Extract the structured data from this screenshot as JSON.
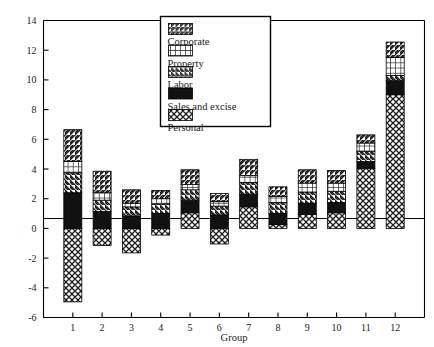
{
  "chart_data": {
    "type": "bar",
    "stacked": true,
    "title": "",
    "xlabel": "Group",
    "ylabel": "",
    "categories": [
      "1",
      "2",
      "3",
      "4",
      "5",
      "6",
      "7",
      "8",
      "9",
      "10",
      "11",
      "12"
    ],
    "ylim": [
      -6,
      14
    ],
    "yticks": [
      -6,
      -4,
      -2,
      0,
      2,
      4,
      6,
      8,
      10,
      12,
      14
    ],
    "xticks": [
      "1",
      "2",
      "3",
      "4",
      "5",
      "6",
      "7",
      "8",
      "9",
      "10",
      "11",
      "12"
    ],
    "grid": false,
    "legend_position": "top-center",
    "series": [
      {
        "name": "Personal",
        "fill": "cross-hatch",
        "values": [
          -4.95,
          -1.15,
          -1.65,
          -0.45,
          1.05,
          -1.05,
          1.45,
          0.25,
          0.95,
          1.05,
          4.05,
          9.0
        ]
      },
      {
        "name": "Sales and excise",
        "fill": "solid-black",
        "values": [
          2.4,
          1.15,
          0.85,
          1.0,
          0.85,
          0.9,
          0.85,
          0.75,
          0.75,
          0.7,
          0.45,
          0.95
        ]
      },
      {
        "name": "Labor",
        "fill": "diagonal-back",
        "values": [
          1.35,
          0.75,
          0.6,
          0.65,
          0.7,
          0.6,
          0.8,
          0.75,
          0.75,
          0.75,
          0.7,
          0.35
        ]
      },
      {
        "name": "Property",
        "fill": "grid-hatch",
        "values": [
          0.75,
          0.5,
          0.25,
          0.35,
          0.35,
          0.3,
          0.45,
          0.4,
          0.6,
          0.55,
          0.55,
          1.2
        ]
      },
      {
        "name": "Corporate",
        "fill": "diagonal-fwd",
        "values": [
          2.15,
          1.45,
          0.9,
          0.55,
          1.0,
          0.55,
          1.1,
          0.65,
          0.9,
          0.85,
          0.55,
          1.05
        ]
      }
    ],
    "bar_totals_positive": [
      6.65,
      3.85,
      2.6,
      2.55,
      3.95,
      2.35,
      4.65,
      2.8,
      3.95,
      3.9,
      6.3,
      12.55
    ],
    "bar_totals_negative": [
      -4.95,
      -1.15,
      -1.65,
      -0.45,
      0,
      -1.05,
      0,
      0,
      0,
      0,
      0,
      0
    ]
  },
  "legend": {
    "entries": [
      {
        "label": "Corporate",
        "fill": "diagonal-fwd"
      },
      {
        "label": "Property",
        "fill": "grid-hatch"
      },
      {
        "label": "Labor",
        "fill": "diagonal-back"
      },
      {
        "label": "Sales and excise",
        "fill": "solid-black"
      },
      {
        "label": "Personal",
        "fill": "cross-hatch"
      }
    ]
  },
  "colors": {
    "axis": "#000000",
    "background": "#ffffff",
    "black_fill": "#111111",
    "hatch_stroke": "#1a1a1a"
  }
}
